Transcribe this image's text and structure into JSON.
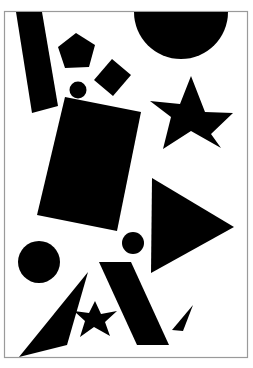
{
  "canvas": {
    "width": 253,
    "height": 368,
    "background_color": "#ffffff",
    "ink_color": "#000000",
    "frame_color": "#9a9a9a",
    "title": "Abstract black shapes composition"
  },
  "frame": {
    "x": 4.5,
    "y": 11.5,
    "width": 243,
    "height": 346,
    "stroke_width": 1.2,
    "label": "page-border"
  },
  "shapes": [
    {
      "id": "bar-diagonal-top-left",
      "name": "tilted-bar",
      "kind": "polygon",
      "points": "16,12 42,12 58,106 32,113",
      "fill": "#000000"
    },
    {
      "id": "pentagon-top",
      "name": "pentagon",
      "kind": "polygon",
      "points": "76,33 95,45 89,67 65,68 58,47",
      "fill": "#000000"
    },
    {
      "id": "square-small-rotated",
      "name": "rotated-square",
      "kind": "polygon",
      "points": "112,59 131,75 113,96 94,80",
      "fill": "#000000"
    },
    {
      "id": "circle-tiny-top",
      "name": "small-circle",
      "kind": "circle",
      "cx": 78,
      "cy": 90,
      "r": 8.5,
      "fill": "#000000"
    },
    {
      "id": "semicircle-top-right",
      "name": "half-disc",
      "kind": "path",
      "d": "M 134 12 A 47 47 0 0 0 228 12 Z",
      "fill": "#000000"
    },
    {
      "id": "star-large-right",
      "name": "five-point-star",
      "kind": "polygon",
      "points": "191,76 205,112 233,113 211,134 221,148 191,131 163,149 171,117 150,101 180,104",
      "fill": "#000000"
    },
    {
      "id": "rectangle-large-rotated",
      "name": "large-rectangle",
      "kind": "polygon",
      "points": "65,97 141,112 117,231 37,215",
      "fill": "#000000"
    },
    {
      "id": "triangle-right-pointing",
      "name": "right-triangle",
      "kind": "polygon",
      "points": "152,178 234,227 151,273",
      "fill": "#000000"
    },
    {
      "id": "circle-mid",
      "name": "medium-circle",
      "kind": "circle",
      "cx": 133,
      "cy": 243,
      "r": 11,
      "fill": "#000000"
    },
    {
      "id": "circle-large-bottom-left",
      "name": "large-circle",
      "kind": "circle",
      "cx": 39,
      "cy": 262,
      "r": 21,
      "fill": "#000000"
    },
    {
      "id": "spike-bottom-left",
      "name": "thin-spike-triangle",
      "kind": "polygon",
      "points": "88,272 67,345 19,357",
      "fill": "#000000"
    },
    {
      "id": "bar-slanted-bottom",
      "name": "slanted-parallelogram",
      "kind": "polygon",
      "points": "99,262 131,262 169,345 137,345",
      "fill": "#000000"
    },
    {
      "id": "star-small-bottom",
      "name": "small-star",
      "kind": "polygon",
      "points": "95,301 101,314 117,311 105,322 110,336 94,327 80,337 85,321 74,311 89,313",
      "fill": "#000000"
    },
    {
      "id": "sliver-bottom-right",
      "name": "sliver-triangle",
      "kind": "polygon",
      "points": "193,305 183,331 172,330",
      "fill": "#000000"
    }
  ]
}
